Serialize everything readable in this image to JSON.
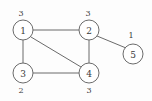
{
  "diagram": {
    "background_color": "#fdfdfd",
    "stroke_color": "#6b6b6b",
    "text_color": "#3a3a3a",
    "nodes": [
      {
        "id": "1",
        "label": "1",
        "weight": "3",
        "cx": 23,
        "cy": 30,
        "r": 10,
        "weight_x": 21,
        "weight_y": 13,
        "weight_pos": "above"
      },
      {
        "id": "2",
        "label": "2",
        "weight": "3",
        "cx": 89,
        "cy": 30,
        "r": 10,
        "weight_x": 88,
        "weight_y": 13,
        "weight_pos": "above"
      },
      {
        "id": "3",
        "label": "3",
        "weight": "2",
        "cx": 23,
        "cy": 73,
        "r": 10,
        "weight_x": 21,
        "weight_y": 90,
        "weight_pos": "below"
      },
      {
        "id": "4",
        "label": "4",
        "weight": "3",
        "cx": 89,
        "cy": 73,
        "r": 10,
        "weight_x": 89,
        "weight_y": 90,
        "weight_pos": "below"
      },
      {
        "id": "5",
        "label": "5",
        "weight": "1",
        "cx": 133,
        "cy": 54,
        "r": 10,
        "weight_x": 131,
        "weight_y": 35,
        "weight_pos": "above"
      }
    ],
    "edges": [
      {
        "id": "e-1-2",
        "from": "1",
        "to": "2",
        "x1": 33,
        "y1": 30,
        "x2": 79,
        "y2": 30
      },
      {
        "id": "e-1-3",
        "from": "1",
        "to": "3",
        "x1": 23,
        "y1": 40,
        "x2": 23,
        "y2": 63
      },
      {
        "id": "e-1-4",
        "from": "1",
        "to": "4",
        "x1": 31,
        "y1": 37,
        "x2": 81,
        "y2": 67
      },
      {
        "id": "e-2-4",
        "from": "2",
        "to": "4",
        "x1": 89,
        "y1": 40,
        "x2": 89,
        "y2": 63
      },
      {
        "id": "e-2-5",
        "from": "2",
        "to": "5",
        "x1": 97,
        "y1": 36,
        "x2": 126,
        "y2": 48
      },
      {
        "id": "e-3-4",
        "from": "3",
        "to": "4",
        "x1": 33,
        "y1": 73,
        "x2": 79,
        "y2": 73
      }
    ]
  }
}
